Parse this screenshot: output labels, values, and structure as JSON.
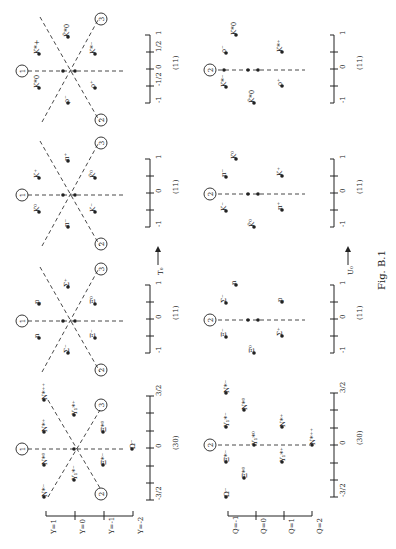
{
  "figure": {
    "caption": "Fig. B.1",
    "operators": {
      "left": "T₀",
      "right": "U₀"
    },
    "axis_markers": [
      "1",
      "2",
      "3"
    ]
  },
  "left_scale": {
    "title": "Y",
    "ticks": [
      "Y=1",
      "Y=0",
      "Y=-1",
      "Y=-2"
    ]
  },
  "right_scale": {
    "title": "Q",
    "ticks": [
      "Q=-1",
      "Q=0",
      "Q=1",
      "Q=2"
    ]
  },
  "panels": [
    {
      "id": "vector-mesons-T",
      "rep": "(11)",
      "ticks": [
        "-1",
        "-1/2",
        "0",
        "1/2",
        "1"
      ],
      "particles": [
        "K*0",
        "K*+",
        "ρ⁻",
        "ω₀",
        "ρ⁰",
        "ρ⁺",
        "K̄*0",
        "K*⁻"
      ]
    },
    {
      "id": "vector-mesons-U",
      "rep": "(11)",
      "ticks": [
        "-1",
        "-1/2",
        "0",
        "1/2",
        "1"
      ],
      "particles": [
        "K̄*0",
        "K*⁻",
        "ρ⁻",
        "√3ρ⁰−ω₀ /2",
        "ρ⁰+√3ω₀ /2",
        "K*0",
        "ρ⁺",
        "K*⁺"
      ]
    },
    {
      "id": "pseudoscalar-mesons-T",
      "rep": "(11)",
      "ticks": [
        "-1",
        "-1/2",
        "0",
        "1/2",
        "1"
      ],
      "particles": [
        "K⁰",
        "K⁺",
        "π⁻",
        "η",
        "π⁰",
        "π⁺",
        "K̄⁰",
        "K⁻"
      ]
    },
    {
      "id": "pseudoscalar-mesons-U",
      "rep": "(11)",
      "ticks": [
        "-1",
        "-1/2",
        "0",
        "1/2",
        "1"
      ],
      "particles": [
        "K̄⁰",
        "K⁻",
        "π⁻",
        "√3π⁰−η /2",
        "π⁰+√3η /2",
        "K⁰",
        "π⁺",
        "K⁺"
      ]
    },
    {
      "id": "baryon-octet-T",
      "rep": "(11)",
      "ticks": [
        "-1",
        "-1/2",
        "0",
        "1/2",
        "1"
      ],
      "particles": [
        "n",
        "p",
        "Σ⁻",
        "Λ",
        "Σ⁰",
        "Σ⁺",
        "Ξ⁻",
        "Ξ⁰"
      ]
    },
    {
      "id": "baryon-octet-U",
      "rep": "(11)",
      "ticks": [
        "-1",
        "-1/2",
        "0",
        "1/2",
        "1"
      ],
      "particles": [
        "Ξ⁰",
        "Ξ⁻",
        "Σ⁻",
        "√3Σ⁰−Λ /2",
        "Σ⁰+√3Λ /2",
        "n",
        "Σ⁺",
        "p"
      ]
    },
    {
      "id": "baryon-decuplet-T",
      "rep": "(30)",
      "ticks": [
        "-3/2",
        "-1",
        "-1/2",
        "0",
        "1/2",
        "1",
        "3/2"
      ],
      "particles": [
        "N*⁻",
        "N*⁰",
        "N*⁺",
        "N*⁺⁺",
        "Y₁*⁻",
        "Y₁*⁰",
        "Y₁*⁺",
        "Ξ*⁻",
        "Ξ*⁰",
        "Ω⁻"
      ]
    },
    {
      "id": "baryon-decuplet-U",
      "rep": "(30)",
      "ticks": [
        "-3/2",
        "-1",
        "-1/2",
        "0",
        "1/2",
        "1",
        "3/2"
      ],
      "particles": [
        "Ω⁻",
        "Ξ*⁻",
        "Ξ*⁰",
        "Y₁*⁻",
        "Y₁*⁰",
        "Y₁*⁺",
        "N*⁻",
        "N*⁰",
        "N*⁺",
        "N*⁺⁺"
      ]
    }
  ]
}
